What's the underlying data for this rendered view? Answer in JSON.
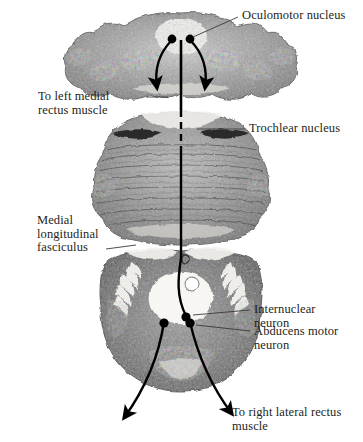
{
  "figure": {
    "kind": "anatomical-illustration",
    "background_color": "#ffffff",
    "ink_color": "#231f20",
    "leader_color": "#3a3a3a"
  },
  "labels": {
    "oculomotor_nucleus": "Oculomotor nucleus",
    "to_left_medial_rectus": "To left medial\nrectus muscle",
    "trochlear_nucleus": "Trochlear nucleus",
    "medial_longitudinal_fasciculus": "Medial\nlongitudinal\nfasciculus",
    "internuclear_neuron": "Internuclear\nneuron",
    "abducens_motor_neuron": "Abducens motor\nneuron",
    "to_right_lateral_rectus": "To right lateral rectus\nmuscle"
  },
  "sections": [
    {
      "name": "midbrain-section",
      "label_ref": "oculomotor_nucleus"
    },
    {
      "name": "pons-section",
      "label_ref": "trochlear_nucleus"
    },
    {
      "name": "lower-pons-section",
      "label_ref": "abducens_motor_neuron"
    }
  ],
  "markers": [
    {
      "name": "oculomotor-nucleus-left-dot"
    },
    {
      "name": "oculomotor-nucleus-right-dot"
    },
    {
      "name": "internuclear-neuron-dot"
    },
    {
      "name": "abducens-motor-neuron-left-dot"
    },
    {
      "name": "abducens-motor-neuron-right-dot"
    }
  ]
}
